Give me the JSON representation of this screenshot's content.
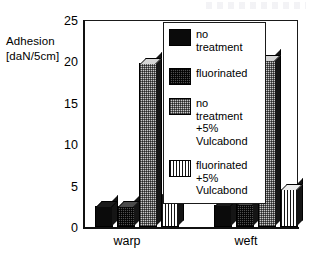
{
  "chart_data": {
    "type": "bar",
    "title": "",
    "xlabel": "",
    "ylabel": "Adhesion [daN/5cm]",
    "ylabel_line1": "Adhesion",
    "ylabel_line2": "[daN/5cm]",
    "categories": [
      "warp",
      "weft"
    ],
    "ylim": [
      0,
      25
    ],
    "yticks": [
      0,
      5,
      10,
      15,
      20,
      25
    ],
    "ytick_labels": [
      "0",
      "5",
      "10",
      "15",
      "20",
      "25"
    ],
    "grid": false,
    "legend_position": "inside-upper-right",
    "series": [
      {
        "name": "no treatment",
        "pattern": "solid-black",
        "color": "#0b0b0b",
        "values": [
          2.5,
          2.7
        ]
      },
      {
        "name": "fluorinated",
        "pattern": "dark-checker",
        "color": "#4f4f4f",
        "values": [
          2.6,
          2.8
        ]
      },
      {
        "name": "no treatment +5% Vulcabond",
        "pattern": "light-checker",
        "color": "#c9c9c9",
        "values": [
          19.9,
          20.3
        ]
      },
      {
        "name": "fluorinated +5% Vulcabond",
        "pattern": "vertical-stripes",
        "color": "#ffffff",
        "values": [
          4.0,
          4.6
        ]
      }
    ]
  },
  "legend": {
    "items": [
      {
        "label": "no\ntreatment"
      },
      {
        "label": "fluorinated"
      },
      {
        "label": "no\ntreatment\n+5%\nVulcabond"
      },
      {
        "label": "fluorinated\n+5%\nVulcabond"
      }
    ]
  },
  "axis": {
    "y_title_line1": "Adhesion",
    "y_title_line2": "[daN/5cm]",
    "tick_25": "25",
    "tick_20": "20",
    "tick_15": "15",
    "tick_10": "10",
    "tick_5": "5",
    "tick_0": "0"
  },
  "xaxis": {
    "cat_warp": "warp",
    "cat_weft": "weft"
  }
}
